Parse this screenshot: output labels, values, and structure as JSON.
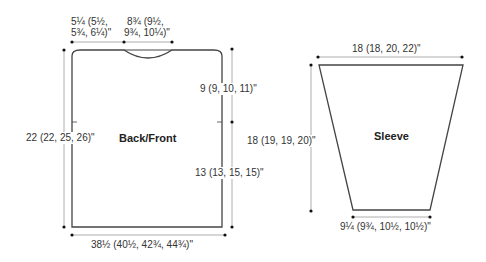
{
  "colors": {
    "outline": "#444444",
    "dimension_line": "#999999",
    "dot": "#111111",
    "text": "#333333"
  },
  "back_front": {
    "title": "Back/Front",
    "shoulder_width": {
      "line1": "5¼ (5½,",
      "line2": "5¾, 6¼)\""
    },
    "neck_width": {
      "line1": "8¾ (9½,",
      "line2": "9¾, 10¼)\""
    },
    "total_length": "22 (22, 25, 26)\"",
    "armhole_depth": "9 (9, 10, 11)\"",
    "side_length": "13 (13, 15, 15)\"",
    "width": "38½ (40½, 42¾, 44¾)\""
  },
  "sleeve": {
    "title": "Sleeve",
    "top_width": "18 (18, 20, 22)\"",
    "length": "18 (19, 19, 20)\"",
    "cuff_width": "9¼ (9¾, 10½, 10½)\""
  }
}
